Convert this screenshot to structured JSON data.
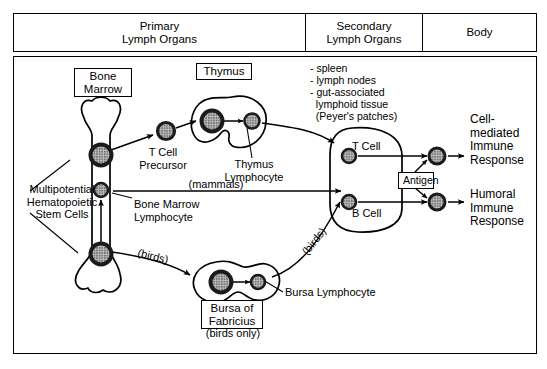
{
  "header": {
    "columns": [
      {
        "id": "primary",
        "label": "Primary\nLymph Organs"
      },
      {
        "id": "secondary",
        "label": "Secondary\nLymph Organs"
      },
      {
        "id": "body",
        "label": "Body"
      }
    ]
  },
  "organs": {
    "bone_marrow": {
      "label": "Bone\nMarrow"
    },
    "thymus": {
      "label": "Thymus"
    },
    "bursa": {
      "label": "Bursa of\nFabricius",
      "note": "(birds only)"
    },
    "secondary_list": "- spleen\n- lymph nodes\n- gut-associated\n  lymphoid tissue\n  (Peyer's patches)"
  },
  "cells": {
    "stem_cells": "Multipotential\nHematopoietic\nStem Cells",
    "t_cell_precursor": "T Cell\nPrecursor",
    "thymus_lymphocyte": "Thymus\nLymphocyte",
    "bone_marrow_lymphocyte": "Bone Marrow\nLymphocyte",
    "bursa_lymphocyte": "Bursa Lymphocyte",
    "t_cell": "T Cell",
    "b_cell": "B Cell",
    "antigen": "Antigen"
  },
  "pathways": {
    "mammals": "(mammals)",
    "birds_lower": "(birds)",
    "birds_upper": "(birds)"
  },
  "responses": {
    "cell_mediated": "Cell-\nmediated\nImmune\nResponse",
    "humoral": "Humoral\nImmune\nResponse"
  },
  "colors": {
    "stroke": "#000000",
    "background": "#ffffff",
    "cell_fill": "#a8a8a8",
    "cell_ring": "#2b2b2b"
  }
}
